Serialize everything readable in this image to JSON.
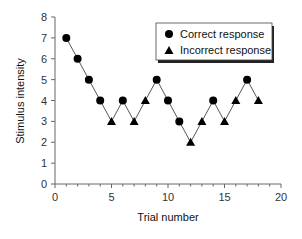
{
  "chart_data": {
    "type": "line",
    "title": "",
    "xlabel": "Trial number",
    "ylabel": "Stimulus intensity",
    "xlim": [
      0,
      20
    ],
    "ylim": [
      0,
      8
    ],
    "x_ticks": [
      0,
      5,
      10,
      15,
      20
    ],
    "y_ticks": [
      0,
      1,
      2,
      3,
      4,
      5,
      6,
      7,
      8
    ],
    "x_minor_tick_step": 1,
    "grid": false,
    "legend_position": "upper right",
    "legend": [
      {
        "label": "Correct response",
        "marker": "circle"
      },
      {
        "label": "Incorrect response",
        "marker": "triangle"
      }
    ],
    "x": [
      1,
      2,
      3,
      4,
      5,
      6,
      7,
      8,
      9,
      10,
      11,
      12,
      13,
      14,
      15,
      16,
      17,
      18
    ],
    "values": [
      7,
      6,
      5,
      4,
      3,
      4,
      3,
      4,
      5,
      4,
      3,
      2,
      3,
      4,
      3,
      4,
      5,
      4
    ],
    "response": [
      "correct",
      "correct",
      "correct",
      "correct",
      "incorrect",
      "correct",
      "incorrect",
      "incorrect",
      "correct",
      "correct",
      "correct",
      "incorrect",
      "incorrect",
      "correct",
      "incorrect",
      "incorrect",
      "correct",
      "incorrect"
    ],
    "series": [
      {
        "name": "Correct response",
        "marker": "circle",
        "x": [
          1,
          2,
          3,
          4,
          6,
          9,
          10,
          11,
          14,
          17
        ],
        "values": [
          7,
          6,
          5,
          4,
          4,
          5,
          4,
          3,
          4,
          5
        ]
      },
      {
        "name": "Incorrect response",
        "marker": "triangle",
        "x": [
          5,
          7,
          8,
          12,
          13,
          15,
          16,
          18
        ],
        "values": [
          3,
          3,
          4,
          2,
          3,
          3,
          4,
          4
        ]
      }
    ],
    "colors": {
      "marker": "#000000",
      "line": "#555555",
      "axis": "#666666"
    }
  }
}
